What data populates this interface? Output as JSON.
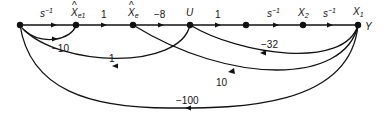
{
  "diagram": {
    "type": "signal-flow-graph",
    "nodes": [
      {
        "id": "in",
        "label": "",
        "x": 20,
        "y": 25
      },
      {
        "id": "xe1",
        "label": "X̂e1",
        "x": 76,
        "y": 25
      },
      {
        "id": "xe",
        "label": "X̂e",
        "x": 133,
        "y": 25
      },
      {
        "id": "u",
        "label": "U",
        "x": 190,
        "y": 25
      },
      {
        "id": "m",
        "label": "",
        "x": 246,
        "y": 25
      },
      {
        "id": "x2",
        "label": "X2",
        "x": 303,
        "y": 25
      },
      {
        "id": "x1",
        "label": "X1",
        "x": 358,
        "y": 25
      }
    ],
    "output_label": "Y",
    "forward_gains": [
      "s⁻¹",
      "1",
      "−8",
      "1",
      "s⁻¹",
      "s⁻¹"
    ],
    "feedback": [
      {
        "from": "xe1",
        "to": "in",
        "gain": "−10"
      },
      {
        "from": "u",
        "to": "in",
        "gain": "1"
      },
      {
        "from": "x1",
        "to": "u",
        "gain": "−32"
      },
      {
        "from": "x1",
        "to": "xe",
        "gain": "10"
      },
      {
        "from": "x1",
        "to": "in",
        "gain": "−100"
      }
    ]
  },
  "labels": {
    "node_xe1_main": "X",
    "node_xe1_sub": "e1",
    "node_xe_main": "X",
    "node_xe_sub": "e",
    "node_u": "U",
    "node_x2_main": "X",
    "node_x2_sub": "2",
    "node_x1_main": "X",
    "node_x1_sub": "1",
    "output_y": "Y",
    "gain_s1": "s",
    "gain_s1_exp": "−1",
    "gain_1a": "1",
    "gain_m8": "−8",
    "gain_1b": "1",
    "gain_s2": "s",
    "gain_s2_exp": "−1",
    "gain_s3": "s",
    "gain_s3_exp": "−1",
    "fb_m10": "−10",
    "fb_1": "1",
    "fb_m32": "−32",
    "fb_10": "10",
    "fb_m100": "−100"
  }
}
